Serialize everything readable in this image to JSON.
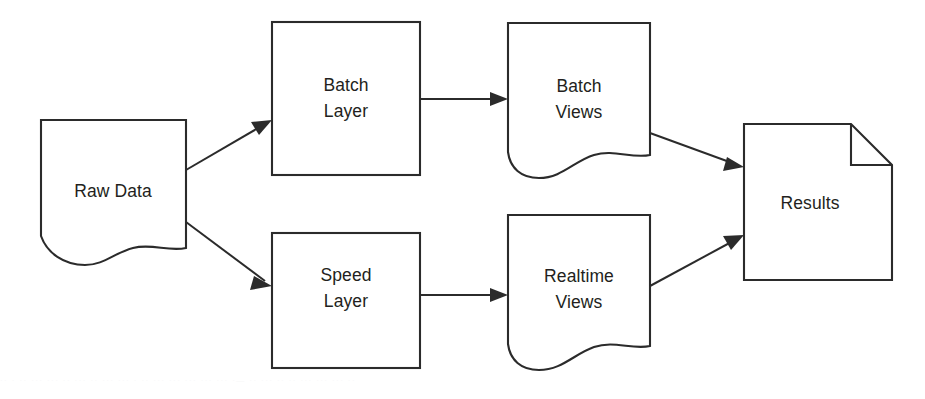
{
  "diagram": {
    "stroke_color": "#2b2b2b",
    "fill_color": "#ffffff",
    "label_color": "#231f20",
    "nodes": [
      {
        "id": "raw-data",
        "label": "Raw Data",
        "shape": "document",
        "x": 41,
        "y": 120,
        "w": 145,
        "h": 145
      },
      {
        "id": "batch-layer",
        "label_line1": "Batch",
        "label_line2": "Layer",
        "label": "Batch Layer",
        "shape": "rectangle",
        "x": 272,
        "y": 22,
        "w": 148,
        "h": 153
      },
      {
        "id": "batch-views",
        "label_line1": "Batch",
        "label_line2": "Views",
        "label": "Batch Views",
        "shape": "document",
        "x": 508,
        "y": 23,
        "w": 142,
        "h": 155
      },
      {
        "id": "speed-layer",
        "label_line1": "Speed",
        "label_line2": "Layer",
        "label": "Speed Layer",
        "shape": "rectangle",
        "x": 272,
        "y": 233,
        "w": 148,
        "h": 135
      },
      {
        "id": "realtime-views",
        "label_line1": "Realtime",
        "label_line2": "Views",
        "label": "Realtime Views",
        "shape": "document",
        "x": 508,
        "y": 215,
        "w": 142,
        "h": 155
      },
      {
        "id": "results",
        "label": "Results",
        "shape": "folded-corner-page",
        "x": 744,
        "y": 124,
        "w": 148,
        "h": 156
      }
    ],
    "edges": [
      {
        "id": "raw-to-batch",
        "from": "raw-data",
        "to": "batch-layer",
        "arrowhead": true
      },
      {
        "id": "raw-to-speed",
        "from": "raw-data",
        "to": "speed-layer",
        "arrowhead": true
      },
      {
        "id": "batch-to-batchviews",
        "from": "batch-layer",
        "to": "batch-views",
        "arrowhead": true
      },
      {
        "id": "speed-to-realtimeviews",
        "from": "speed-layer",
        "to": "realtime-views",
        "arrowhead": true
      },
      {
        "id": "batchviews-to-results",
        "from": "batch-views",
        "to": "results",
        "arrowhead": true
      },
      {
        "id": "realtimeviews-to-results",
        "from": "realtime-views",
        "to": "results",
        "arrowhead": true
      }
    ]
  },
  "scan_artifact": {
    "text": "··  ·  ·· ··· ··· ··  ···  ·· ···    ···     ·  ··  ···     ··· ··· ··· ···  ·—  ·· ··· ··   ·· ···  ··· ···   ··"
  }
}
